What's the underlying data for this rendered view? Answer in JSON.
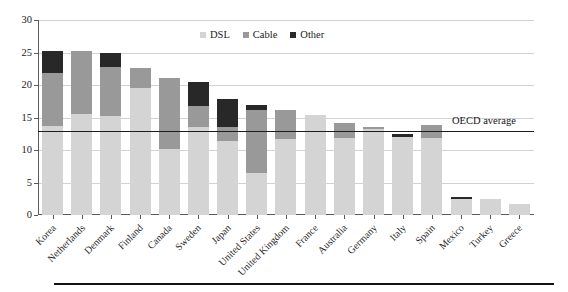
{
  "chart_data": {
    "type": "bar",
    "subtype": "stacked-bar",
    "title": "",
    "xlabel": "",
    "ylabel": "",
    "ylim": [
      0,
      30
    ],
    "ytick_step": 5,
    "yticks": [
      0,
      5,
      10,
      15,
      20,
      25,
      30
    ],
    "grid": true,
    "grid_axis": "y",
    "legend_position": "top-center",
    "categories": [
      "Korea",
      "Netherlands",
      "Denmark",
      "Finland",
      "Canada",
      "Sweden",
      "Japan",
      "United States",
      "United Kingdom",
      "France",
      "Australia",
      "Germany",
      "Italy",
      "Spain",
      "Mexico",
      "Turkey",
      "Greece"
    ],
    "series": [
      {
        "name": "DSL",
        "color": "#d4d4d4",
        "values": [
          13.7,
          15.6,
          15.3,
          19.5,
          10.1,
          13.5,
          11.4,
          6.5,
          11.7,
          15.4,
          11.8,
          13.2,
          12.0,
          11.8,
          2.4,
          2.4,
          1.7
        ]
      },
      {
        "name": "Cable",
        "color": "#999999",
        "values": [
          8.2,
          9.6,
          7.5,
          3.1,
          11.0,
          3.3,
          2.2,
          9.7,
          4.4,
          0.0,
          2.4,
          0.3,
          0.0,
          2.1,
          0.0,
          0.0,
          0.0
        ]
      },
      {
        "name": "Other",
        "color": "#282828",
        "values": [
          3.4,
          0.0,
          2.1,
          0.0,
          0.0,
          3.7,
          4.3,
          0.8,
          0.0,
          0.0,
          0.0,
          0.0,
          0.5,
          0.0,
          0.3,
          0.0,
          0.0
        ]
      }
    ],
    "totals": [
      25.3,
      25.2,
      24.9,
      22.6,
      21.1,
      20.5,
      17.9,
      17.0,
      16.1,
      15.4,
      14.2,
      13.5,
      12.5,
      13.9,
      2.7,
      2.4,
      1.7
    ],
    "reference_line": {
      "label": "OECD average",
      "value": 13.0,
      "color": "#1c1c1c"
    }
  },
  "legend": {
    "items": [
      {
        "label": "DSL",
        "swatch": "dsl-swatch",
        "color": "#d4d4d4"
      },
      {
        "label": "Cable",
        "swatch": "cable-swatch",
        "color": "#999999"
      },
      {
        "label": "Other",
        "swatch": "other-swatch",
        "color": "#282828"
      }
    ]
  },
  "axis": {
    "y_tick_labels": [
      "0",
      "5",
      "10",
      "15",
      "20",
      "25",
      "30"
    ]
  }
}
